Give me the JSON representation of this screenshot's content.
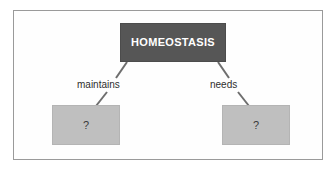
{
  "figure": {
    "frame": {
      "border_color": "#9a9a9a",
      "background_color": "#fefefe"
    },
    "nodes": [
      {
        "id": "homeostasis",
        "label": "HOMEOSTASIS",
        "fill_color": "#565656",
        "text_color": "#ffffff"
      },
      {
        "id": "blank-left",
        "label": "?",
        "fill_color": "#bfbfbf",
        "text_color": "#3a3a3a"
      },
      {
        "id": "blank-right",
        "label": "?",
        "fill_color": "#bfbfbf",
        "text_color": "#3a3a3a"
      }
    ],
    "edges": [
      {
        "id": "maintains",
        "label": "maintains",
        "from": "homeostasis",
        "to": "blank-left"
      },
      {
        "id": "needs",
        "label": "needs",
        "from": "homeostasis",
        "to": "blank-right"
      }
    ],
    "connector_color": "#6e6e6e"
  }
}
